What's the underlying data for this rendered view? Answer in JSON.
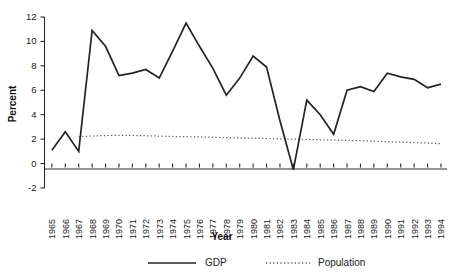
{
  "chart_data": {
    "type": "line",
    "title": "",
    "xlabel": "Year",
    "ylabel": "Percent",
    "ylim": [
      -2,
      12
    ],
    "yticks": [
      -2,
      0,
      2,
      4,
      6,
      8,
      10,
      12
    ],
    "ytick_labels": [
      "-2",
      "0",
      "2",
      "4",
      "6",
      "8",
      "10",
      "12"
    ],
    "grid": false,
    "legend_position": "bottom",
    "categories": [
      "1965",
      "1966",
      "1967",
      "1968",
      "1969",
      "1970",
      "1971",
      "1972",
      "1973",
      "1974",
      "1975",
      "1976",
      "1977",
      "1978",
      "1979",
      "1980",
      "1981",
      "1982",
      "1983",
      "1984",
      "1985",
      "1986",
      "1987",
      "1988",
      "1989",
      "1990",
      "1991",
      "1992",
      "1993",
      "1994"
    ],
    "series": [
      {
        "name": "GDP",
        "style": "solid",
        "color": "#232323",
        "values": [
          1.1,
          2.6,
          1.0,
          10.9,
          9.6,
          7.2,
          7.4,
          7.7,
          7.0,
          9.2,
          11.5,
          9.6,
          7.8,
          5.6,
          7.0,
          8.8,
          7.9,
          3.5,
          -0.5,
          5.2,
          4.0,
          2.4,
          6.0,
          6.3,
          5.9,
          7.4,
          7.1,
          6.9,
          6.2,
          6.5
        ]
      },
      {
        "name": "Population",
        "style": "dotted",
        "color": "#555555",
        "values": [
          null,
          null,
          2.2,
          2.25,
          2.3,
          2.3,
          2.3,
          2.28,
          2.25,
          2.22,
          2.2,
          2.18,
          2.15,
          2.12,
          2.1,
          2.08,
          2.05,
          2.02,
          2.0,
          1.98,
          1.95,
          1.92,
          1.9,
          1.87,
          1.84,
          1.8,
          1.76,
          1.72,
          1.68,
          1.62
        ]
      }
    ]
  },
  "legend": {
    "entries": [
      {
        "label": "GDP"
      },
      {
        "label": "Population"
      }
    ]
  },
  "axes": {
    "y_title": "Percent",
    "x_title": "Year"
  }
}
